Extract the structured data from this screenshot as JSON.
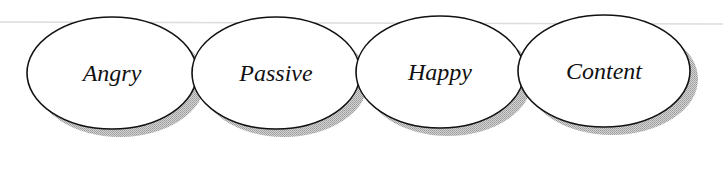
{
  "diagram": {
    "type": "ellipse-sequence",
    "colors": {
      "background": "#ffffff",
      "stroke": "#111111",
      "fill": "#ffffff",
      "shadow": "#bdbdbd",
      "rule_line": "#dcdcdc"
    },
    "nodes": [
      {
        "id": "angry",
        "label": "Angry",
        "cx": 112,
        "cy": 73,
        "rx": 85,
        "ry": 56
      },
      {
        "id": "passive",
        "label": "Passive",
        "cx": 276,
        "cy": 73,
        "rx": 84,
        "ry": 56
      },
      {
        "id": "happy",
        "label": "Happy",
        "cx": 440,
        "cy": 72,
        "rx": 84,
        "ry": 56
      },
      {
        "id": "content",
        "label": "Content",
        "cx": 604,
        "cy": 71,
        "rx": 86,
        "ry": 56
      }
    ]
  }
}
